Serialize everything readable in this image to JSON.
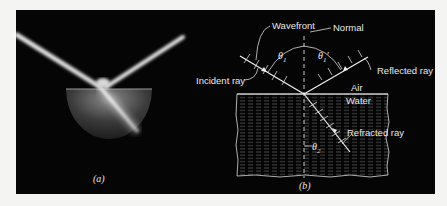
{
  "figure": {
    "panel_a": {
      "caption": "(a)",
      "description": "Photograph of a light beam reflecting and refracting at a semicircular water tank surface"
    },
    "panel_b": {
      "caption": "(b)",
      "labels": {
        "wavefront": "Wavefront",
        "normal": "Normal",
        "incident_ray": "Incident ray",
        "reflected_ray": "Reflected ray",
        "air": "Air",
        "water": "Water",
        "refracted_ray": "Refracted ray",
        "theta1": "θ",
        "theta1_sub": "1",
        "theta1p": "θ",
        "theta1p_sub": "1",
        "theta1p_prime": "′",
        "theta2": "θ",
        "theta2_sub": "2"
      }
    },
    "colors": {
      "background": "#050505",
      "page": "#f4f4f2",
      "line": "#e8e8e8"
    }
  }
}
